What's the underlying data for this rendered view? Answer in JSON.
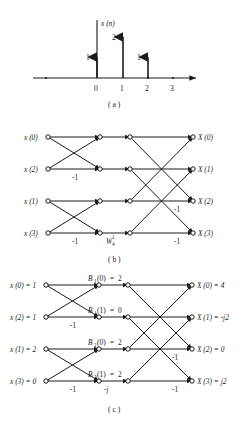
{
  "figure": {
    "type": "signal-flow-graph"
  },
  "panel_a": {
    "caption": "( a )",
    "signal_label": "x (n)",
    "axis_label": "n",
    "ticks": [
      "0",
      "1",
      "2",
      "3"
    ],
    "stem_values": [
      "1",
      "2",
      "1"
    ],
    "stems": [
      {
        "n": 0,
        "value": 1,
        "label": "1"
      },
      {
        "n": 1,
        "value": 2,
        "label": "2"
      },
      {
        "n": 2,
        "value": 1,
        "label": "1"
      },
      {
        "n": 3,
        "value": 0,
        "label": ""
      }
    ],
    "ylim": [
      0,
      2
    ],
    "xlim": [
      -1,
      4
    ]
  },
  "panel_b": {
    "caption": "( b )",
    "inputs": [
      "x (0)",
      "x (2)",
      "x (1)",
      "x (3)"
    ],
    "outputs": [
      "X (0)",
      "X (1)",
      "X (2)",
      "X (3)"
    ],
    "stage1_coefficients": [
      "-1",
      "-1"
    ],
    "twiddle_label": "W",
    "twiddle_sub": "4",
    "twiddle_sup": "1",
    "stage2_coefficients": [
      "-1",
      "-1"
    ]
  },
  "panel_c": {
    "caption": "( c )",
    "inputs": [
      "x (0) = 1",
      "x (2) = 1",
      "x (1) = 2",
      "x (3) = 0"
    ],
    "outputs": [
      "X (0) = 4",
      "X (1) = -j2",
      "X (2) = 0",
      "X (3) = j2"
    ],
    "intermediate": [
      {
        "name": "B",
        "sub": "1",
        "arg": "(0)",
        "value": "2",
        "text": "B  (0) = 2"
      },
      {
        "name": "B",
        "sub": "1",
        "arg": "(1)",
        "value": "0",
        "text": "B  (1) = 0"
      },
      {
        "name": "B",
        "sub": "2",
        "arg": "(0)",
        "value": "2",
        "text": "B  (0) = 2"
      },
      {
        "name": "B",
        "sub": "2",
        "arg": "(1)",
        "value": "2",
        "text": "B  (1) = 2"
      }
    ],
    "stage1_coefficients": [
      "-1",
      "-1"
    ],
    "twiddle_coefficient": "-j",
    "stage2_coefficients": [
      "-1",
      "-1"
    ],
    "input_values": [
      1,
      1,
      2,
      0
    ],
    "output_values": [
      "4",
      "-j2",
      "0",
      "j2"
    ]
  },
  "colors": {
    "ink": "#1a1a1a",
    "background": "#ffffff"
  }
}
